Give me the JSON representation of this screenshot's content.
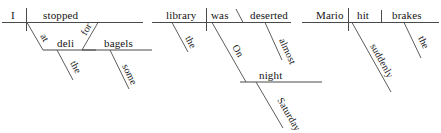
{
  "page": {
    "background_color": "#ffffff",
    "ink_color": "#4a4a4a",
    "text_color": "#141414"
  },
  "diagrams": [
    {
      "id": "diagram-1",
      "sentence": "I stopped at the deli for some bagels",
      "subject": "I",
      "verb": "stopped",
      "words": {
        "subject": "I",
        "verb": "stopped",
        "prep1": "at",
        "object1": "deli",
        "article1": "the",
        "prep2": "for",
        "object2": "bagels",
        "determiner2": "some"
      }
    },
    {
      "id": "diagram-2",
      "sentence": "The library was deserted almost on Saturday night",
      "subject": "library",
      "verb": "was",
      "words": {
        "subject": "library",
        "article_subject": "the",
        "verb": "was",
        "predicate_adjective": "deserted",
        "adverb": "almost",
        "prep": "On",
        "object": "night",
        "modifier": "Saturday"
      }
    },
    {
      "id": "diagram-3",
      "sentence": "Mario hit the brakes suddenly",
      "subject": "Mario",
      "verb": "hit",
      "words": {
        "subject": "Mario",
        "verb": "hit",
        "object": "brakes",
        "article_object": "the",
        "adverb": "suddenly"
      }
    }
  ]
}
